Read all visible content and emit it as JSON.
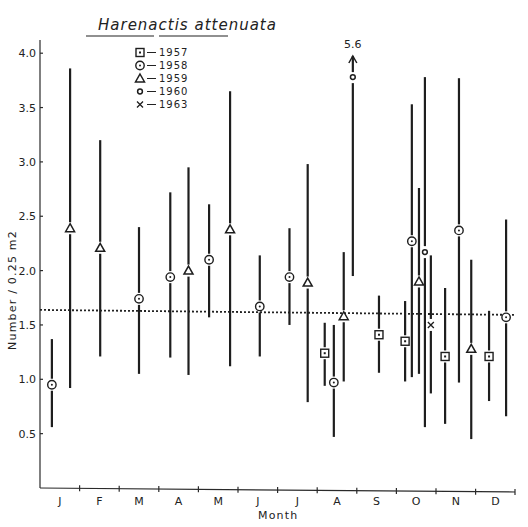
{
  "chart_data": {
    "type": "scatter",
    "title": "Harenactis attenuata",
    "xlabel": "Month",
    "ylabel": "Number / 0.25 m2",
    "ylim": [
      0,
      4.3
    ],
    "yticks": [
      0.5,
      1.0,
      1.5,
      2.0,
      2.5,
      3.0,
      3.5,
      4.0
    ],
    "ytick_labels": [
      "0.5",
      "1.0",
      "1.5",
      "2.0",
      "2.5",
      "3.0",
      "3.5",
      "4.0"
    ],
    "categories": [
      "J",
      "F",
      "M",
      "A",
      "M",
      "J",
      "J",
      "A",
      "S",
      "O",
      "N",
      "D"
    ],
    "grid": false,
    "mean_line": {
      "value": 1.62,
      "style": "dotted"
    },
    "legend": [
      {
        "symbol": "square",
        "label": "1957"
      },
      {
        "symbol": "circle",
        "label": "1958"
      },
      {
        "symbol": "triangle",
        "label": "1959"
      },
      {
        "symbol": "dot",
        "label": "1960"
      },
      {
        "symbol": "x",
        "label": "1963"
      }
    ],
    "annotation": {
      "text": "5.6",
      "note": "error bar of August 1960 point extends to 5.6 (arrow)"
    },
    "points": [
      {
        "month_pos": 0.3,
        "year": "1958",
        "symbol": "circle",
        "value": 0.95,
        "low": 0.56,
        "high": 1.37
      },
      {
        "month_pos": 0.76,
        "year": "1959",
        "symbol": "triangle",
        "value": 2.39,
        "low": 0.92,
        "high": 3.86
      },
      {
        "month_pos": 1.52,
        "year": "1959",
        "symbol": "triangle",
        "value": 2.21,
        "low": 1.21,
        "high": 3.2
      },
      {
        "month_pos": 2.5,
        "year": "1958",
        "symbol": "circle",
        "value": 1.74,
        "low": 1.05,
        "high": 2.4
      },
      {
        "month_pos": 3.29,
        "year": "1958",
        "symbol": "circle",
        "value": 1.94,
        "low": 1.2,
        "high": 2.72
      },
      {
        "month_pos": 3.75,
        "year": "1959",
        "symbol": "triangle",
        "value": 2.0,
        "low": 1.04,
        "high": 2.95
      },
      {
        "month_pos": 4.27,
        "year": "1958",
        "symbol": "circle",
        "value": 2.1,
        "low": 1.57,
        "high": 2.61
      },
      {
        "month_pos": 4.8,
        "year": "1959",
        "symbol": "triangle",
        "value": 2.38,
        "low": 1.12,
        "high": 3.65
      },
      {
        "month_pos": 5.55,
        "year": "1958",
        "symbol": "circle",
        "value": 1.67,
        "low": 1.21,
        "high": 2.14
      },
      {
        "month_pos": 6.3,
        "year": "1958",
        "symbol": "circle",
        "value": 1.94,
        "low": 1.5,
        "high": 2.39
      },
      {
        "month_pos": 6.76,
        "year": "1959",
        "symbol": "triangle",
        "value": 1.89,
        "low": 0.79,
        "high": 2.98
      },
      {
        "month_pos": 7.19,
        "year": "1957",
        "symbol": "square",
        "value": 1.24,
        "low": 0.94,
        "high": 1.52
      },
      {
        "month_pos": 7.42,
        "year": "1958",
        "symbol": "circle",
        "value": 0.97,
        "low": 0.47,
        "high": 1.5
      },
      {
        "month_pos": 7.67,
        "year": "1959",
        "symbol": "triangle",
        "value": 1.58,
        "low": 0.98,
        "high": 2.17
      },
      {
        "month_pos": 7.9,
        "year": "1960",
        "symbol": "dot",
        "value": 3.78,
        "low": 1.95,
        "high": 5.6,
        "arrow": true
      },
      {
        "month_pos": 8.56,
        "year": "1957",
        "symbol": "square",
        "value": 1.41,
        "low": 1.06,
        "high": 1.77
      },
      {
        "month_pos": 9.22,
        "year": "1957",
        "symbol": "square",
        "value": 1.35,
        "low": 0.98,
        "high": 1.72
      },
      {
        "month_pos": 9.39,
        "year": "1958",
        "symbol": "circle",
        "value": 2.27,
        "low": 1.02,
        "high": 3.53
      },
      {
        "month_pos": 9.57,
        "year": "1959",
        "symbol": "triangle",
        "value": 1.9,
        "low": 1.05,
        "high": 2.76
      },
      {
        "month_pos": 9.72,
        "year": "1960",
        "symbol": "dot",
        "value": 2.17,
        "low": 0.56,
        "high": 3.78
      },
      {
        "month_pos": 9.87,
        "year": "1963",
        "symbol": "x",
        "value": 1.5,
        "low": 0.87,
        "high": 2.14
      },
      {
        "month_pos": 10.23,
        "year": "1957",
        "symbol": "square",
        "value": 1.21,
        "low": 0.59,
        "high": 1.84
      },
      {
        "month_pos": 10.58,
        "year": "1958",
        "symbol": "circle",
        "value": 2.37,
        "low": 0.97,
        "high": 3.77
      },
      {
        "month_pos": 10.89,
        "year": "1959",
        "symbol": "triangle",
        "value": 1.28,
        "low": 0.45,
        "high": 2.1
      },
      {
        "month_pos": 11.34,
        "year": "1957",
        "symbol": "square",
        "value": 1.21,
        "low": 0.8,
        "high": 1.63
      },
      {
        "month_pos": 11.77,
        "year": "1958",
        "symbol": "circle",
        "value": 1.57,
        "low": 0.66,
        "high": 2.47
      }
    ]
  }
}
